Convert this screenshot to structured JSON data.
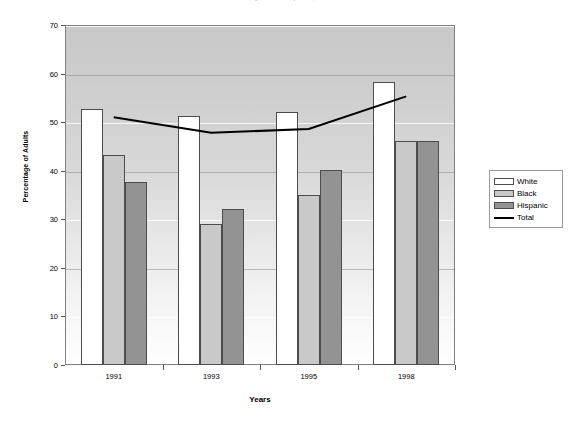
{
  "chart_data": {
    "type": "bar",
    "title": "Percentage of Adults by Race, 1991-1998",
    "xlabel": "Years",
    "ylabel": "Percentage of Adults",
    "categories": [
      "1991",
      "1993",
      "1995",
      "1998"
    ],
    "ylim": [
      0,
      70
    ],
    "ytick_step": 10,
    "yticks": [
      "70",
      "60",
      "50",
      "40",
      "30",
      "20",
      "10",
      "0"
    ],
    "grid": true,
    "legend_position": "right",
    "series": [
      {
        "name": "White",
        "type": "bar",
        "color": "#ffffff",
        "values": [
          52.7,
          51.3,
          52.0,
          58.3
        ]
      },
      {
        "name": "Black",
        "type": "bar",
        "color": "#c9c9c9",
        "values": [
          43.3,
          29.0,
          35.0,
          46.2
        ]
      },
      {
        "name": "Hispanic",
        "type": "bar",
        "color": "#939393",
        "values": [
          37.6,
          32.2,
          40.2,
          46.1
        ]
      },
      {
        "name": "Total",
        "type": "line",
        "color": "#000000",
        "values": [
          51.0,
          47.8,
          48.6,
          55.3
        ]
      }
    ]
  },
  "legend": {
    "items": [
      {
        "label": "White"
      },
      {
        "label": "Black"
      },
      {
        "label": "Hispanic"
      },
      {
        "label": "Total"
      }
    ]
  }
}
